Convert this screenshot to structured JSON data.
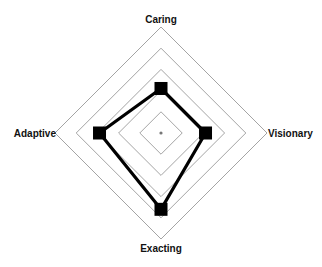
{
  "chart_data": {
    "type": "radar",
    "title": "",
    "axes": [
      "Caring",
      "Visionary",
      "Exacting",
      "Adaptive"
    ],
    "rings": 5,
    "range": [
      0,
      5
    ],
    "series": [
      {
        "name": "Profile",
        "values": [
          2.1,
          2.1,
          3.6,
          2.9
        ],
        "color": "#000000"
      }
    ],
    "grid": true,
    "legend": null
  },
  "labels": {
    "top": "Caring",
    "right": "Visionary",
    "bottom": "Exacting",
    "left": "Adaptive"
  },
  "colors": {
    "grid": "#9a9a9a",
    "series": "#000000",
    "text": "#111111"
  }
}
